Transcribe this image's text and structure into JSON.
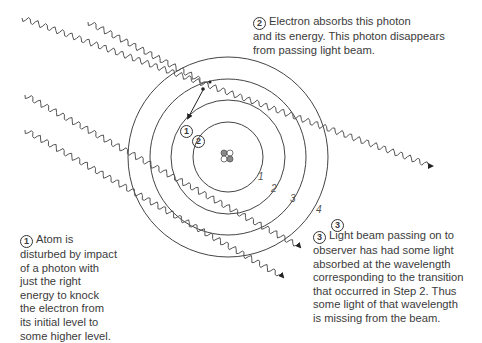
{
  "diagram": {
    "type": "bohr-atom-absorption",
    "atom": {
      "center": [
        228,
        157
      ],
      "rings": [
        {
          "label": "1",
          "radius": 35
        },
        {
          "label": "2",
          "radius": 57
        },
        {
          "label": "3",
          "radius": 78
        },
        {
          "label": "4",
          "radius": 100
        }
      ]
    },
    "markers": {
      "step1": "1",
      "step2": "2",
      "step3": "3"
    }
  },
  "captions": {
    "step2": {
      "number": "2",
      "lines": [
        "Electron absorbs this photon",
        "and its energy. This photon disappears",
        "from passing light beam."
      ]
    },
    "step1": {
      "number": "1",
      "lines": [
        "Atom is",
        "disturbed by impact",
        "of a photon with",
        "just the right",
        "energy to knock",
        "the electron from",
        "its initial level to",
        "some higher level."
      ]
    },
    "step3": {
      "number": "3",
      "lines": [
        "Light beam passing on to",
        "observer has had some light",
        "absorbed at the wavelength",
        "corresponding to the transition",
        "that occurred in Step 2. Thus",
        "some light of that wavelength",
        "is missing from the beam."
      ]
    }
  }
}
